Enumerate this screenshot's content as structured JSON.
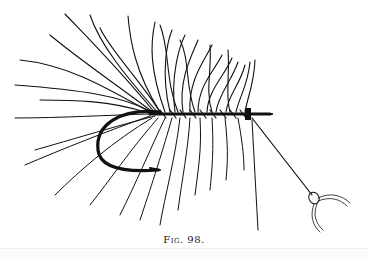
{
  "figure": {
    "caption": "Fig. 98."
  },
  "colors": {
    "ink": "#111111",
    "paper": "#ffffff"
  }
}
